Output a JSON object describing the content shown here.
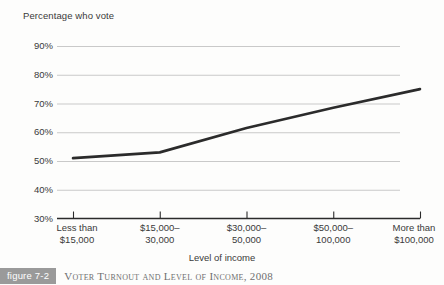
{
  "chart_data": {
    "type": "line",
    "title": "Percentage who vote",
    "xlabel": "Level of income",
    "ylabel": "",
    "categories": [
      "Less than $15,000",
      "$15,000–30,000",
      "$30,000–50,000",
      "$50,000–100,000",
      "More than $100,000"
    ],
    "category_lines": [
      [
        "Less than",
        "$15,000"
      ],
      [
        "$15,000–",
        "30,000"
      ],
      [
        "$30,000–",
        "50,000"
      ],
      [
        "$50,000–",
        "100,000"
      ],
      [
        "More than",
        "$100,000"
      ]
    ],
    "values": [
      51,
      53,
      61.5,
      68.5,
      75
    ],
    "ylim": [
      30,
      90
    ],
    "yticks": [
      90,
      80,
      70,
      60,
      50,
      40,
      30
    ],
    "ytick_labels": [
      "90%",
      "80%",
      "70%",
      "60%",
      "50%",
      "40%",
      "30%"
    ],
    "grid": true,
    "legend": "none",
    "line_color": "#2b2b2b",
    "grid_color": "#c9c9c9",
    "axis_color": "#2b2b2b"
  },
  "caption": {
    "badge": "figure 7-2",
    "text": "Voter Turnout and Level of Income, 2008",
    "badge_color": "#9a9a9a"
  }
}
